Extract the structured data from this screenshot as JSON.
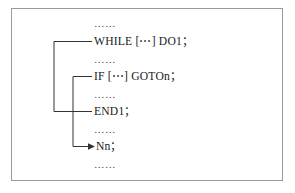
{
  "figure": {
    "border_color": "#9a9a9a",
    "text_color": "#1a1a1a",
    "background": "#ffffff"
  },
  "code_lines": [
    {
      "id": "line-0",
      "kind": "ellipsis",
      "text": "……"
    },
    {
      "id": "line-1",
      "kind": "statement",
      "text": "WHILE [⋯] DO1；"
    },
    {
      "id": "line-2",
      "kind": "ellipsis",
      "text": "……"
    },
    {
      "id": "line-3",
      "kind": "statement",
      "text": "IF [⋯] GOTOn；"
    },
    {
      "id": "line-4",
      "kind": "ellipsis",
      "text": "……"
    },
    {
      "id": "line-5",
      "kind": "statement",
      "text": "END1；"
    },
    {
      "id": "line-6",
      "kind": "ellipsis",
      "text": "……"
    },
    {
      "id": "line-7",
      "kind": "statement",
      "text": "Nn；"
    },
    {
      "id": "line-8",
      "kind": "ellipsis",
      "text": "……"
    }
  ],
  "connectors": {
    "outer": {
      "name": "while-end-bracket",
      "from_label": "WHILE [⋯] DO1；",
      "to_label": "END1；",
      "color": "#333333"
    },
    "inner": {
      "name": "if-goto-bracket",
      "from_label": "IF [⋯] GOTOn；",
      "to_label": "Nn；",
      "color": "#333333",
      "arrow": "right-arrowhead"
    }
  }
}
